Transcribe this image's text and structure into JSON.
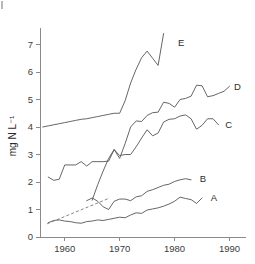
{
  "chart_data": {
    "type": "line",
    "title": "",
    "subtitle": "",
    "xlabel": "",
    "ylabel": "mg N L⁻¹",
    "xlim": [
      1955.5,
      1993
    ],
    "ylim": [
      0,
      7.6
    ],
    "grid": false,
    "legend_position": "inline-right-end-labels",
    "xticks": [
      1960,
      1970,
      1980,
      1990
    ],
    "xtick_labels": [
      "1960",
      "1970",
      "1980",
      "1990"
    ],
    "yticks": [
      0,
      1,
      2,
      3,
      4,
      5,
      6,
      7
    ],
    "ytick_labels": [
      "0",
      "1",
      "2",
      "3",
      "4",
      "5",
      "6",
      "7"
    ],
    "series": [
      {
        "name": "A",
        "label": "A",
        "style": "solid",
        "label_x": 1986.6,
        "label_y": 1.44,
        "x": [
          1957,
          1958,
          1959,
          1960,
          1961,
          1962,
          1963,
          1964,
          1965,
          1966,
          1967,
          1968,
          1969,
          1970,
          1971,
          1972,
          1973,
          1974,
          1975,
          1976,
          1977,
          1978,
          1979,
          1980,
          1981,
          1982,
          1983,
          1984,
          1985
        ],
        "y": [
          0.52,
          0.6,
          0.62,
          0.58,
          0.56,
          0.52,
          0.5,
          0.56,
          0.58,
          0.62,
          0.6,
          0.64,
          0.68,
          0.72,
          0.7,
          0.8,
          0.88,
          0.86,
          0.98,
          1.02,
          1.06,
          1.12,
          1.2,
          1.3,
          1.45,
          1.4,
          1.36,
          1.22,
          1.42
        ]
      },
      {
        "name": "B",
        "label": "B",
        "style": "solid",
        "label_x": 1984.6,
        "label_y": 2.12,
        "x": [
          1964,
          1965,
          1966,
          1967,
          1968,
          1969,
          1970,
          1971,
          1972,
          1973,
          1974,
          1975,
          1976,
          1977,
          1978,
          1979,
          1980,
          1981,
          1982,
          1983
        ],
        "y": [
          1.32,
          1.42,
          1.3,
          1.1,
          1.0,
          1.3,
          1.38,
          1.38,
          1.32,
          1.46,
          1.5,
          1.66,
          1.72,
          1.8,
          1.88,
          1.92,
          2.02,
          2.08,
          2.12,
          2.08
        ]
      },
      {
        "name": "C",
        "label": "C",
        "style": "solid",
        "label_x": 1989.2,
        "label_y": 4.08,
        "x": [
          1957,
          1958,
          1959,
          1960,
          1961,
          1962,
          1963,
          1964,
          1965,
          1966,
          1967,
          1968,
          1969,
          1970,
          1971,
          1972,
          1973,
          1974,
          1975,
          1976,
          1977,
          1978,
          1979,
          1980,
          1981,
          1982,
          1983,
          1984,
          1985,
          1986,
          1987,
          1988
        ],
        "y": [
          2.18,
          2.06,
          2.1,
          2.62,
          2.62,
          2.62,
          2.74,
          2.58,
          2.74,
          2.74,
          2.74,
          2.76,
          3.18,
          2.96,
          3.0,
          3.0,
          3.28,
          3.6,
          3.9,
          3.68,
          3.78,
          4.18,
          4.28,
          4.3,
          4.4,
          4.44,
          4.3,
          3.92,
          4.06,
          4.3,
          4.3,
          4.08
        ]
      },
      {
        "name": "D",
        "label": "D",
        "style": "solid",
        "label_x": 1990.8,
        "label_y": 5.46,
        "x": [
          1965,
          1966,
          1967,
          1968,
          1969,
          1970,
          1971,
          1972,
          1973,
          1974,
          1975,
          1976,
          1977,
          1978,
          1979,
          1980,
          1981,
          1982,
          1983,
          1984,
          1985,
          1986,
          1987,
          1988,
          1989,
          1990
        ],
        "y": [
          1.34,
          1.9,
          2.4,
          2.86,
          3.18,
          2.86,
          3.4,
          4.0,
          4.22,
          4.2,
          4.42,
          4.52,
          4.54,
          4.9,
          4.86,
          4.72,
          5.0,
          5.04,
          5.12,
          5.52,
          5.5,
          5.1,
          5.14,
          5.22,
          5.3,
          5.48
        ]
      },
      {
        "name": "E",
        "label": "E",
        "style": "solid",
        "label_x": 1980.6,
        "label_y": 7.08,
        "x": [
          1956,
          1957,
          1958,
          1959,
          1960,
          1961,
          1962,
          1963,
          1964,
          1965,
          1966,
          1967,
          1968,
          1969,
          1970,
          1971,
          1972,
          1973,
          1974,
          1975,
          1976,
          1977,
          1978
        ],
        "y": [
          4.0,
          4.04,
          4.08,
          4.12,
          4.16,
          4.2,
          4.24,
          4.28,
          4.3,
          4.34,
          4.38,
          4.42,
          4.46,
          4.5,
          4.5,
          4.96,
          5.6,
          6.1,
          6.52,
          6.76,
          6.5,
          6.24,
          7.4
        ]
      },
      {
        "name": "trend-dashed",
        "label": "",
        "style": "dashed",
        "x": [
          1956.8,
          1968.2
        ],
        "y": [
          0.48,
          1.42
        ]
      }
    ],
    "annotations": []
  }
}
